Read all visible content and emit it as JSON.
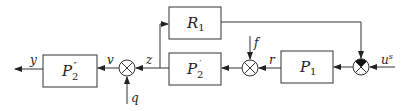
{
  "diagram": {
    "type": "block-diagram",
    "blocks": [
      {
        "id": "P2pp",
        "label": "P",
        "sub": "2",
        "sup": "″"
      },
      {
        "id": "P2p",
        "label": "P",
        "sub": "2",
        "sup": "′"
      },
      {
        "id": "R1",
        "label": "R",
        "sub": "1",
        "sup": ""
      },
      {
        "id": "P1",
        "label": "P",
        "sub": "1",
        "sup": ""
      }
    ],
    "signals": {
      "y": "y",
      "v": "v",
      "z": "z",
      "q": "q",
      "f": "f",
      "r": "r",
      "us": "u",
      "us_sup": "s"
    },
    "summing_junctions": [
      {
        "id": "sum-left",
        "style": "cross",
        "inputs": [
          "z",
          "q"
        ],
        "output": "v"
      },
      {
        "id": "sum-middle",
        "style": "cross",
        "inputs": [
          "r",
          "f"
        ],
        "output": "to P2'"
      },
      {
        "id": "sum-right",
        "style": "cross-filled-top",
        "inputs": [
          "u^s",
          "R1 feedback"
        ],
        "output": "to P1"
      }
    ],
    "connections": [
      "u^s -> sum-right",
      "sum-right -> P1",
      "P1 -> r -> sum-middle",
      "f -> sum-middle",
      "sum-middle -> P2'",
      "P2' -> z -> junction",
      "junction -> R1",
      "R1 -> sum-right",
      "junction -> sum-left",
      "q -> sum-left",
      "sum-left -> v -> P2''",
      "P2'' -> y"
    ]
  }
}
